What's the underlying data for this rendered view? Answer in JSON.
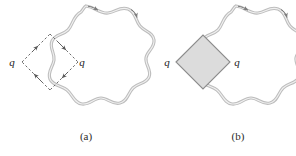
{
  "figure": {
    "background_color": "#ffffff",
    "curve_color": "#9a9a9a",
    "curve_highlight_color": "#d8d8d8",
    "path_color": "#5a5a5a",
    "shade_fill": "#dcdcdc",
    "shade_stroke": "#8c8c8c",
    "text_color": "#2b2b2b"
  },
  "panels": [
    {
      "id": "a",
      "caption": "(a)",
      "caption_x": 86,
      "caption_y": 140,
      "loop": {
        "name": "wavy-closed-curve",
        "center_x": 86,
        "center_y": 62,
        "radius_outer": 56,
        "radius_inner": 46,
        "lobes": 9,
        "direction_arrows": 2
      },
      "square": {
        "name": "dashed-diamond-path",
        "style": "dashed",
        "shaded": false,
        "vertices": [
          {
            "x": 22,
            "y": 62
          },
          {
            "x": 50,
            "y": 34
          },
          {
            "x": 78,
            "y": 62
          },
          {
            "x": 50,
            "y": 90
          }
        ],
        "arrow_count": 4,
        "orientation": "clockwise"
      },
      "labels": [
        {
          "text": "q",
          "x": 12,
          "y": 66
        },
        {
          "text": "q",
          "x": 82,
          "y": 66
        }
      ]
    },
    {
      "id": "b",
      "caption": "(b)",
      "caption_x": 238,
      "caption_y": 140,
      "loop": {
        "name": "wavy-closed-curve",
        "center_x": 236,
        "center_y": 62,
        "radius_outer": 56,
        "radius_inner": 46,
        "lobes": 9,
        "direction_arrows": 2
      },
      "square": {
        "name": "shaded-diamond-region",
        "style": "solid",
        "shaded": true,
        "vertices": [
          {
            "x": 176,
            "y": 62
          },
          {
            "x": 203,
            "y": 35
          },
          {
            "x": 230,
            "y": 62
          },
          {
            "x": 203,
            "y": 89
          }
        ],
        "arrow_count": 0,
        "orientation": "none"
      },
      "labels": [
        {
          "text": "q",
          "x": 167,
          "y": 66
        },
        {
          "text": "q",
          "x": 237,
          "y": 66
        }
      ]
    }
  ]
}
